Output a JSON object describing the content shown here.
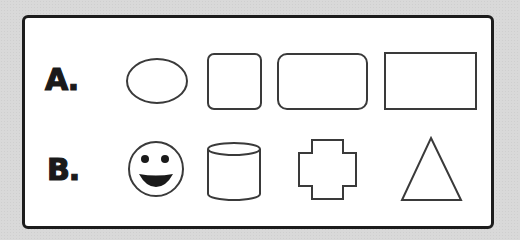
{
  "rows": [
    {
      "label": "A.",
      "shapes": [
        "ellipse",
        "rounded-square",
        "rounded-rectangle",
        "rectangle"
      ]
    },
    {
      "label": "B.",
      "shapes": [
        "smiley-face",
        "cylinder",
        "cross",
        "triangle"
      ]
    }
  ],
  "colors": {
    "stroke": "#3a3a3a",
    "frame": "#1c1c1c",
    "fill": "#ffffff",
    "background": "#d9d9d9"
  }
}
